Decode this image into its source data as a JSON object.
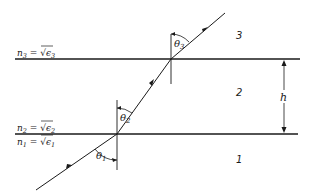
{
  "diagram": {
    "title": "",
    "interfaces": [
      {
        "id": "top",
        "label_lhs": "n",
        "label_sub": "3",
        "label_eps_sub": "3"
      },
      {
        "id": "bottom",
        "above_lhs": "n",
        "above_sub": "2",
        "above_eps_sub": "2",
        "below_lhs": "n",
        "below_sub": "1",
        "below_eps_sub": "1"
      }
    ],
    "regions": {
      "r3": "3",
      "r2": "2",
      "r1": "1"
    },
    "angles": {
      "theta1": {
        "sym": "θ",
        "sub": "1"
      },
      "theta2": {
        "sym": "θ",
        "sub": "2"
      },
      "theta3": {
        "sym": "θ",
        "sub": "3"
      }
    },
    "thickness_label": "h",
    "eq": " = ",
    "sqrt": "√",
    "eps": "ϵ",
    "colors": {
      "line": "#1a1a1a",
      "background": "#ffffff"
    }
  }
}
